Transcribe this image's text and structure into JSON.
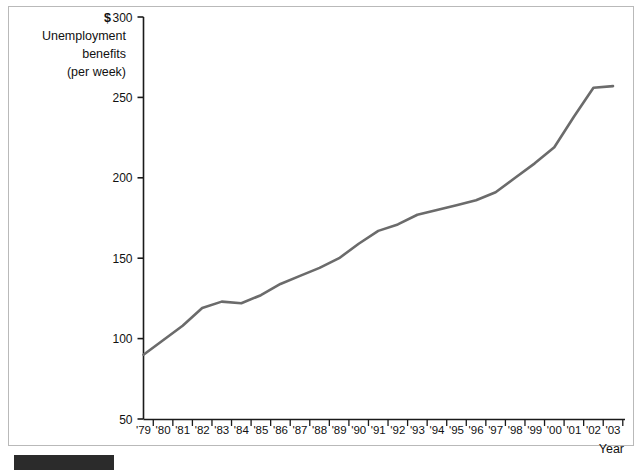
{
  "chart_data": {
    "type": "line",
    "title": "",
    "subtitle": "",
    "ylabel_lines": [
      "Unemployment",
      "benefits",
      "(per week)"
    ],
    "currency_symbol": "$",
    "xlabel": "Year",
    "categories": [
      "'79",
      "'80",
      "'81",
      "'82",
      "'83",
      "'84",
      "'85",
      "'86",
      "'87",
      "'88",
      "'89",
      "'90",
      "'91",
      "'92",
      "'93",
      "'94",
      "'95",
      "'96",
      "'97",
      "'98",
      "'99",
      "'00",
      "'01",
      "'02",
      "'03"
    ],
    "x_values": [
      1979,
      1980,
      1981,
      1982,
      1983,
      1984,
      1985,
      1986,
      1987,
      1988,
      1989,
      1990,
      1991,
      1992,
      1993,
      1994,
      1995,
      1996,
      1997,
      1998,
      1999,
      2000,
      2001,
      2002,
      2003
    ],
    "values": [
      90,
      99,
      108,
      119,
      123,
      122,
      127,
      134,
      139,
      144,
      150,
      159,
      167,
      171,
      177,
      180,
      183,
      186,
      191,
      200,
      209,
      219,
      238,
      256,
      257
    ],
    "series": [
      {
        "name": "Unemployment benefits (per week)",
        "values": [
          90,
          99,
          108,
          119,
          123,
          122,
          127,
          134,
          139,
          144,
          150,
          159,
          167,
          171,
          177,
          180,
          183,
          186,
          191,
          200,
          209,
          219,
          238,
          256,
          257
        ]
      }
    ],
    "ytick_labels": [
      "300",
      "250",
      "200",
      "150",
      "100",
      "50"
    ],
    "ytick_values": [
      300,
      250,
      200,
      150,
      100,
      50
    ],
    "ylim": [
      50,
      300
    ],
    "xlim": [
      1979,
      2003
    ],
    "grid": false,
    "legend": "none",
    "line_color": "#6b6b6b",
    "axis_color": "#1a1a1a",
    "frame_color": "#b9b9b9",
    "background_color": "#ffffff"
  },
  "caption": {
    "bar_label": ""
  }
}
